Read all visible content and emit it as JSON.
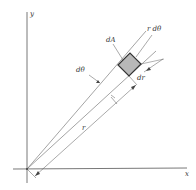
{
  "diagram": {
    "axes": {
      "x_label": "x",
      "y_label": "y"
    },
    "labels": {
      "area_element": "dA",
      "arc_length": "r dθ",
      "angle_increment": "dθ",
      "radial_increment": "dr",
      "radius": "r"
    },
    "colors": {
      "line": "#555555",
      "shaded_element": "#b8b8b8",
      "element_border": "#333333",
      "background": "#ffffff"
    }
  }
}
